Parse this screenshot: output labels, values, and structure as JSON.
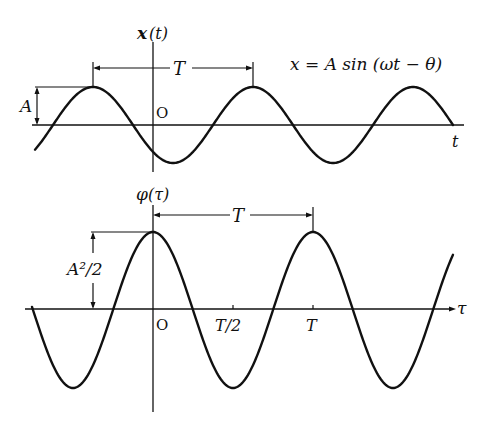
{
  "chart_data": [
    {
      "type": "line",
      "title": "",
      "ylabel": "x(t)",
      "xlabel": "t",
      "equation": "x = A sin (ωt − θ)",
      "origin_label": "O",
      "annotations": [
        {
          "label": "T",
          "kind": "period-arrow",
          "from_peak": 1,
          "to_peak": 2
        },
        {
          "label": "A",
          "kind": "amplitude-bracket"
        }
      ],
      "x": [
        -2.0,
        -1.5,
        -1.0,
        -0.5,
        0.0,
        0.5,
        1.0,
        1.5,
        2.0,
        2.5
      ],
      "series": [
        {
          "name": "x(t)",
          "description": "A sin(ωt − θ), amplitude A, period T, peak at t ≈ -0.375T"
        }
      ],
      "amplitude": "A",
      "period": "T"
    },
    {
      "type": "line",
      "title": "",
      "ylabel": "φ(τ)",
      "xlabel": "τ",
      "origin_label": "O",
      "xticks": [
        "O",
        "T/2",
        "T"
      ],
      "annotations": [
        {
          "label": "T",
          "kind": "period-arrow",
          "from": "0",
          "to": "T"
        },
        {
          "label": "A²/2",
          "kind": "amplitude-bracket"
        }
      ],
      "series": [
        {
          "name": "φ(τ)",
          "description": "(A²/2) cos(ωτ), maximum A²/2 at τ = 0 and τ = T, minima at τ = -T/2, T/2, 3T/2"
        }
      ],
      "amplitude": "A²/2",
      "period": "T"
    }
  ],
  "top": {
    "ylabel": "x",
    "ylabel_arg": "(t)",
    "xlabel": "t",
    "origin": "O",
    "period_label": "T",
    "amp_label": "A",
    "equation": "x = A sin (ωt − θ)"
  },
  "bottom": {
    "ylabel": "φ",
    "ylabel_arg": "(τ)",
    "xlabel": "τ",
    "origin": "O",
    "tick_half": "T/2",
    "tick_T": "T",
    "period_label": "T",
    "amp_label": "A²/2"
  }
}
